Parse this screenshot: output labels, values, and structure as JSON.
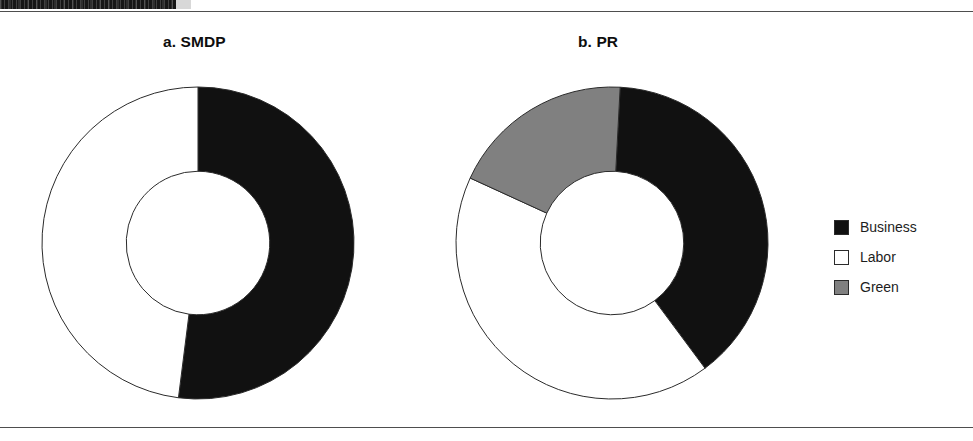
{
  "figure": {
    "background_color": "#ffffff",
    "rule_color": "#4e4e4e",
    "header_band": {
      "name": "cropped-header-band",
      "color": "#161616",
      "tail_color": "#d8d8d8",
      "text": ""
    }
  },
  "panels": [
    {
      "id": "a",
      "title": "a. SMDP"
    },
    {
      "id": "b",
      "title": "b. PR"
    }
  ],
  "legend": {
    "position": "right",
    "items": [
      {
        "label": "Business",
        "color": "#111111",
        "swatch": "filled-black-square"
      },
      {
        "label": "Labor",
        "color": "#ffffff",
        "swatch": "outlined-white-square"
      },
      {
        "label": "Green",
        "color": "#808080",
        "swatch": "filled-gray-square"
      }
    ]
  },
  "chart_data": [
    {
      "type": "pie",
      "variant": "donut",
      "title": "a. SMDP",
      "labels": [
        "Business",
        "Labor"
      ],
      "values": [
        52,
        48
      ],
      "unit": "percent",
      "colors": [
        "#111111",
        "#ffffff"
      ],
      "start_angle_deg": 0,
      "direction": "clockwise",
      "inner_radius_ratio": 0.46,
      "stroke_color": "#2b2b2b",
      "legend": "shared-right",
      "grid": false
    },
    {
      "type": "pie",
      "variant": "donut",
      "title": "b. PR",
      "labels": [
        "Business",
        "Labor",
        "Green"
      ],
      "values": [
        39,
        42,
        19
      ],
      "unit": "percent",
      "colors": [
        "#111111",
        "#ffffff",
        "#808080"
      ],
      "start_angle_deg": 3,
      "direction": "clockwise",
      "inner_radius_ratio": 0.46,
      "stroke_color": "#2b2b2b",
      "legend": "shared-right",
      "grid": false
    }
  ]
}
